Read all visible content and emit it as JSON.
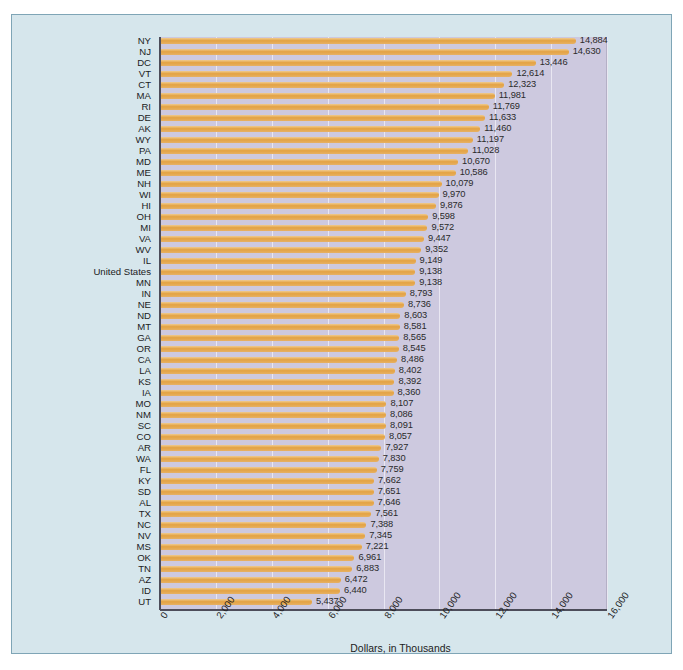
{
  "page": {
    "top_partial_text": "",
    "background_color": "#ffffff"
  },
  "figure": {
    "panel_color": "#d6e6ec",
    "panel_border_color": "#7fa5b6",
    "plot_background_color": "#cdc9df",
    "bar_color": "#e3a243",
    "gridline_color": "#e9e7f2",
    "axis_color": "#4d4d5a"
  },
  "chart_data": {
    "type": "bar",
    "orientation": "horizontal",
    "title": "",
    "xlabel": "Dollars, in Thousands",
    "ylabel": "",
    "xlim": [
      0,
      16000
    ],
    "xticks": [
      "0",
      "2,000",
      "4,000",
      "6,000",
      "8,000",
      "10,000",
      "12,000",
      "14,000",
      "16,000"
    ],
    "xtick_values": [
      0,
      2000,
      4000,
      6000,
      8000,
      10000,
      12000,
      14000,
      16000
    ],
    "grid": true,
    "legend": null,
    "sorted": "descending",
    "categories": [
      "NY",
      "NJ",
      "DC",
      "VT",
      "CT",
      "MA",
      "RI",
      "DE",
      "AK",
      "WY",
      "PA",
      "MD",
      "ME",
      "NH",
      "WI",
      "HI",
      "OH",
      "MI",
      "VA",
      "WV",
      "IL",
      "United States",
      "MN",
      "IN",
      "NE",
      "ND",
      "MT",
      "GA",
      "OR",
      "CA",
      "LA",
      "KS",
      "IA",
      "MO",
      "NM",
      "SC",
      "CO",
      "AR",
      "WA",
      "FL",
      "KY",
      "SD",
      "AL",
      "TX",
      "NC",
      "NV",
      "MS",
      "OK",
      "TN",
      "AZ",
      "ID",
      "UT"
    ],
    "values": [
      14884,
      14630,
      13446,
      12614,
      12323,
      11981,
      11769,
      11633,
      11460,
      11197,
      11028,
      10670,
      10586,
      10079,
      9970,
      9876,
      9598,
      9572,
      9447,
      9352,
      9149,
      9138,
      9138,
      8793,
      8736,
      8603,
      8581,
      8565,
      8545,
      8486,
      8402,
      8392,
      8360,
      8107,
      8086,
      8091,
      8057,
      7927,
      7830,
      7759,
      7662,
      7651,
      7646,
      7561,
      7388,
      7345,
      7221,
      6961,
      6883,
      6472,
      6440,
      5437
    ],
    "value_labels": [
      "14,884",
      "14,630",
      "13,446",
      "12,614",
      "12,323",
      "11,981",
      "11,769",
      "11,633",
      "11,460",
      "11,197",
      "11,028",
      "10,670",
      "10,586",
      "10,079",
      "9,970",
      "9,876",
      "9,598",
      "9,572",
      "9,447",
      "9,352",
      "9,149",
      "9,138",
      "9,138",
      "8,793",
      "8,736",
      "8,603",
      "8,581",
      "8,565",
      "8,545",
      "8,486",
      "8,402",
      "8,392",
      "8,360",
      "8,107",
      "8,086",
      "8,091",
      "8,057",
      "7,927",
      "7,830",
      "7,759",
      "7,662",
      "7,651",
      "7,646",
      "7,561",
      "7,388",
      "7,345",
      "7,221",
      "6,961",
      "6,883",
      "6,472",
      "6,440",
      "5,437"
    ]
  }
}
